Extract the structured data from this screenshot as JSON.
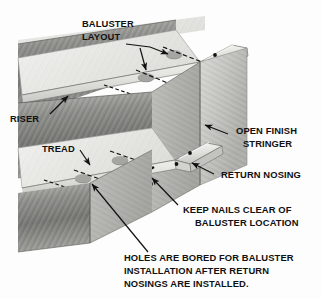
{
  "figure": {
    "type": "technical-isometric-illustration",
    "background_color": "#fdfdfd",
    "line_color": "#111111"
  },
  "labels": {
    "baluster_layout_l1": "BALUSTER",
    "baluster_layout_l2": "LAYOUT",
    "riser": "RISER",
    "tread": "TREAD",
    "open_finish_stringer_l1": "OPEN FINISH",
    "open_finish_stringer_l2": "STRINGER",
    "return_nosing": "RETURN NOSING",
    "keep_nails_l1": "KEEP NAILS CLEAR OF",
    "keep_nails_l2": "BALUSTER LOCATION",
    "holes_note_l1": "HOLES ARE BORED FOR BALUSTER",
    "holes_note_l2": "INSTALLATION AFTER RETURN",
    "holes_note_l3": "NOSINGS ARE INSTALLED."
  },
  "colors": {
    "tread_top": "#e8e8e6",
    "tread_top_shade": "#d6d6d3",
    "nosing_light": "#efefec",
    "nosing_mid": "#cfcfcb",
    "riser_dark": "#9a9a97",
    "riser_darker": "#7e7e7b",
    "stringer_face": "#c9c9c5",
    "stringer_shade": "#b0b0ac",
    "edge": "#3a3a3a",
    "hole": "#8e8e8b"
  },
  "parts": [
    {
      "name": "tread",
      "count": 2,
      "description": "horizontal stair tread with bored baluster holes"
    },
    {
      "name": "riser",
      "count": 2,
      "description": "vertical board below tread nosing"
    },
    {
      "name": "open-finish-stringer",
      "count": 1,
      "description": "outer mitred finish stringer face"
    },
    {
      "name": "return-nosing",
      "count": 2,
      "description": "returned nosing strip on open end of tread"
    },
    {
      "name": "baluster-hole",
      "count": 4,
      "description": "bored hole for baluster"
    },
    {
      "name": "nail-mark",
      "count": 6,
      "description": "nail locations kept clear of baluster holes"
    },
    {
      "name": "layout-centerline",
      "count": 6,
      "description": "dashed baluster layout centerlines"
    }
  ]
}
